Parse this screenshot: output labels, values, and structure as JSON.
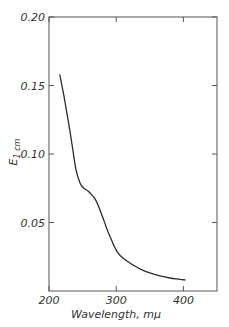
{
  "chart_data": {
    "type": "line",
    "title": "",
    "xlabel": "Wavelength, mμ",
    "ylabel": "E1cm",
    "ylabel_main": "E",
    "ylabel_sub": "1 cm",
    "xlim": [
      200,
      450
    ],
    "ylim": [
      0,
      0.2
    ],
    "grid": false,
    "legend": null,
    "x_ticks": [
      200,
      300,
      400
    ],
    "x_tick_labels": [
      "200",
      "300",
      "400"
    ],
    "y_ticks": [
      0.05,
      0.1,
      0.15,
      0.2
    ],
    "y_tick_labels": [
      "0.05",
      "0.10",
      "0.15",
      "0.20"
    ],
    "series": [
      {
        "name": "absorption",
        "x": [
          216,
          222,
          228,
          234,
          240,
          246,
          252,
          258,
          264,
          270,
          276,
          282,
          288,
          295,
          301,
          310,
          325,
          340,
          351,
          365,
          380,
          395,
          403
        ],
        "y": [
          0.158,
          0.143,
          0.126,
          0.108,
          0.089,
          0.079,
          0.075,
          0.073,
          0.07,
          0.066,
          0.059,
          0.051,
          0.043,
          0.035,
          0.029,
          0.024,
          0.019,
          0.015,
          0.013,
          0.011,
          0.0095,
          0.0085,
          0.008
        ]
      }
    ]
  }
}
